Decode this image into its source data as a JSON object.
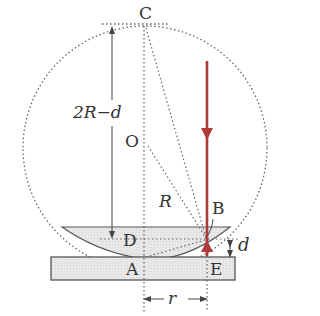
{
  "diagram": {
    "labels": {
      "C": "C",
      "O": "O",
      "R": "R",
      "B": "B",
      "D": "D",
      "A": "A",
      "E": "E",
      "d": "d",
      "r": "r",
      "two_r_minus_d": "2R−d"
    },
    "colors": {
      "light_ray": "#b03a3a",
      "lines": "#555555",
      "glass_fill": "#e6e6e6",
      "glass_stroke": "#555555",
      "background": "#ffffff"
    },
    "elements": {
      "circle": "dotted reference circle of radius R centered at O",
      "lens": "plano-convex lens (shaded), curved face down touching plate at A",
      "plate": "flat glass plate (shaded rectangle)",
      "ray": "vertical red light ray going down then reflected up at B",
      "dimension_2R_minus_d": "vertical arrow from D up to C",
      "dimension_d": "small double arrow between B level and plate top at E",
      "dimension_r": "horizontal double arrow between A and E below plate"
    }
  }
}
